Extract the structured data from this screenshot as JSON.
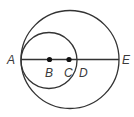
{
  "diagram": {
    "type": "geometry-circles",
    "stroke_color": "#333333",
    "large_circle": {
      "center_point": "C",
      "passes_through": [
        "A",
        "E"
      ]
    },
    "small_circle": {
      "center_point": "B",
      "passes_through": [
        "A",
        "D"
      ]
    },
    "segment": {
      "from": "A",
      "to": "E"
    },
    "points": [
      {
        "label": "A",
        "on_line": true,
        "dot": false
      },
      {
        "label": "B",
        "on_line": true,
        "dot": true
      },
      {
        "label": "C",
        "on_line": true,
        "dot": true
      },
      {
        "label": "D",
        "on_line": true,
        "dot": false
      },
      {
        "label": "E",
        "on_line": true,
        "dot": false
      }
    ]
  }
}
